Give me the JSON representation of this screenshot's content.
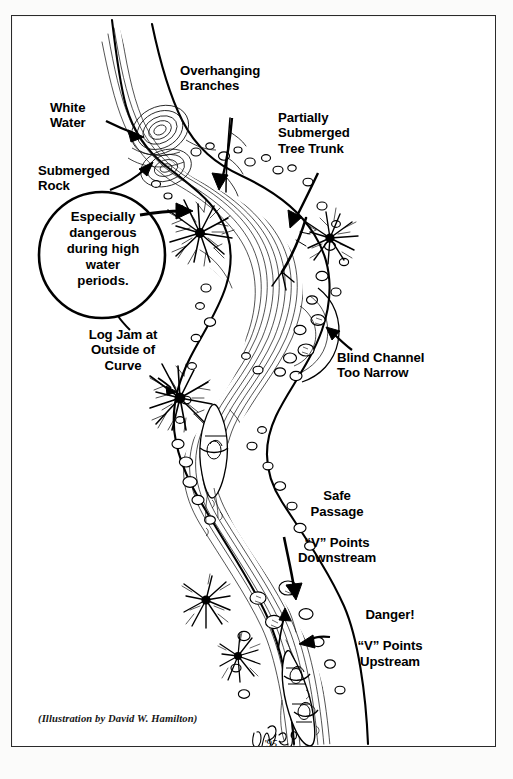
{
  "figure": {
    "credit": "(Illustration by David W. Hamilton)",
    "signature": "DWH '95",
    "ink_color": "#000000",
    "paper_color": "#ffffff",
    "frame_color": "#2a2a2a"
  },
  "labels": {
    "white_water": "White\nWater",
    "overhanging_branches": "Overhanging\nBranches",
    "partially_submerged_tree_trunk": "Partially\nSubmerged\nTree Trunk",
    "submerged_rock": "Submerged\nRock",
    "log_jam": "Log Jam at\nOutside of\nCurve",
    "blind_channel": "Blind Channel\nToo Narrow",
    "safe_passage_emphasis": "Safe\nPassage",
    "safe_passage_detail": "“V” Points\nDownstream",
    "danger_emphasis": "Danger!",
    "danger_detail": "“V” Points\nUpstream"
  },
  "callout": {
    "text": "Especially\ndangerous\nduring high\nwater\nperiods."
  }
}
